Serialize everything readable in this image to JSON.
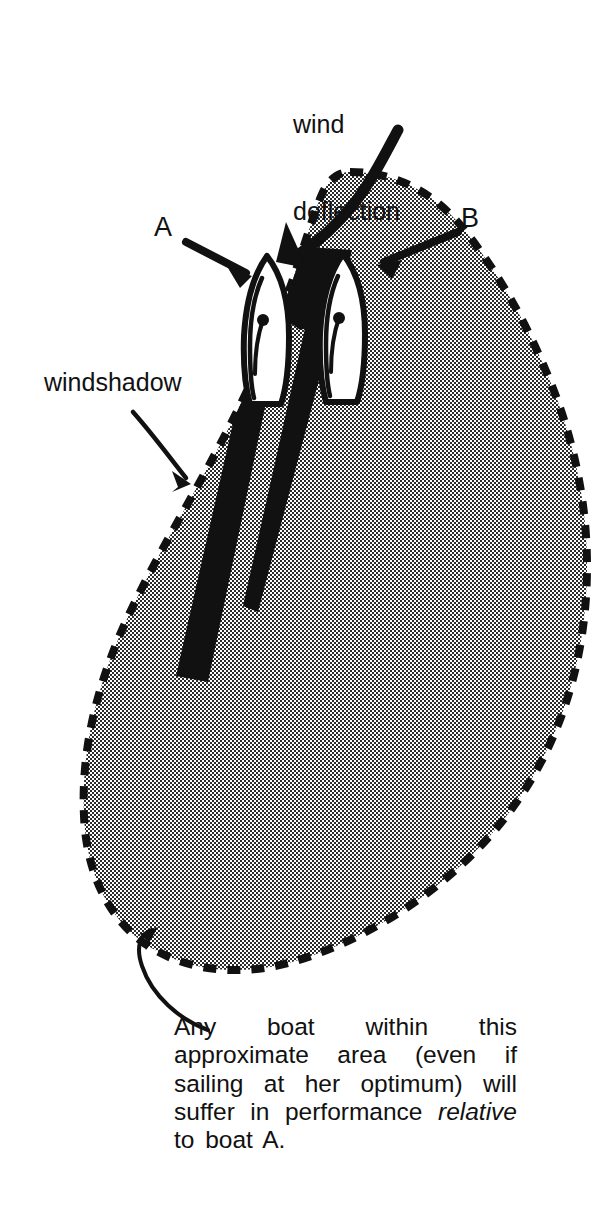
{
  "figure": {
    "labels": {
      "wind_deflection_line1": "wind",
      "wind_deflection_line2": "deflection",
      "windshadow": "windshadow",
      "boat_a": "A",
      "boat_b": "B"
    },
    "caption": {
      "part1": "Any boat within this approximate area (even if sailing at her optimum) will suffer in performance ",
      "emphasis": "relative",
      "part2": " to boat A."
    },
    "colors": {
      "ink": "#111111",
      "halftone_gray": "#9a9a9a",
      "shadow_black": "#111111",
      "paper": "#ffffff",
      "hull_fill": "#ffffff"
    },
    "elements": {
      "disturbed_area": "dashed-outline teardrop region",
      "windshadow_wedge_a": "solid black wedge trailing boat A",
      "windshadow_wedge_b": "solid black wedge trailing boat B",
      "boat_a_icon": "white hull with sail and mast dot",
      "boat_b_icon": "white hull with sail and mast dot",
      "wind_deflection_arrow": "curved arrow bending left over boat A",
      "windshadow_arrow": "curved arrow pointing to black wedge",
      "caption_arrow": "curved arrow pointing to dashed boundary"
    }
  }
}
